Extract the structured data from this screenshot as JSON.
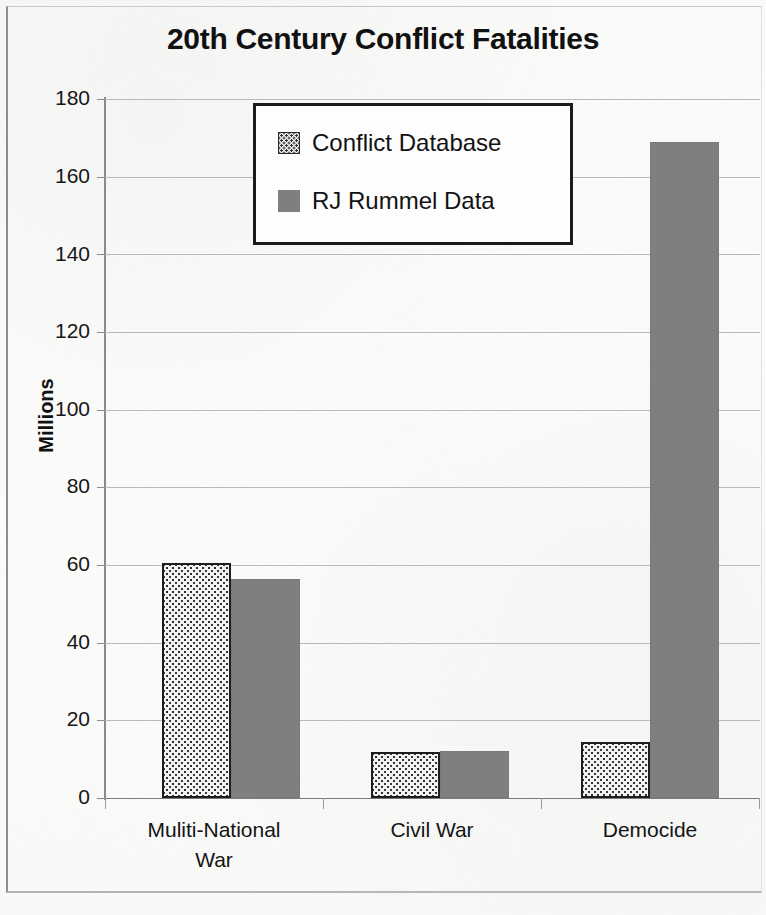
{
  "chart_data": {
    "type": "bar",
    "title": "20th Century Conflict Fatalities",
    "xlabel": "",
    "ylabel": "Millions",
    "ylim": [
      0,
      180
    ],
    "yticks": [
      0,
      20,
      40,
      60,
      80,
      100,
      120,
      140,
      160,
      180
    ],
    "grid": true,
    "legend_position": "upper center (inside plot)",
    "categories": [
      "Muliti-National War",
      "Civil War",
      "Democide"
    ],
    "series": [
      {
        "name": "Conflict Database",
        "color": "#f2f2f2",
        "pattern": "fine-dotted",
        "values": [
          60.5,
          11.8,
          14.5
        ]
      },
      {
        "name": "RJ Rummel Data",
        "color": "#7f7f7f",
        "pattern": "solid",
        "values": [
          56.5,
          12.0,
          169.0
        ]
      }
    ]
  },
  "axis": {
    "y_tick_labels": [
      "180",
      "160",
      "140",
      "120",
      "100",
      "80",
      "60",
      "40",
      "20",
      "0"
    ],
    "y_title": "Millions",
    "x_category_labels": [
      [
        "Muliti-National",
        "War"
      ],
      [
        "Civil War"
      ],
      [
        "Democide"
      ]
    ]
  },
  "legend": {
    "entries": [
      {
        "label": "Conflict Database"
      },
      {
        "label": "RJ Rummel Data"
      }
    ]
  }
}
